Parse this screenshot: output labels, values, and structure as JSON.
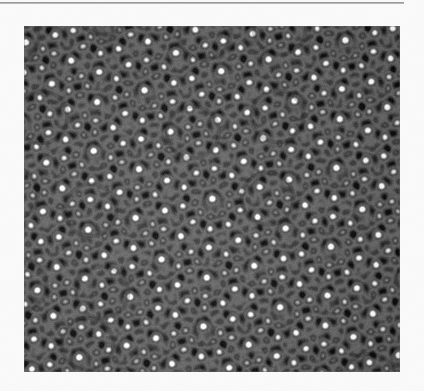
{
  "page": {
    "width": 424,
    "height": 391,
    "background_color": "#fafafa",
    "kind": "scanned-journal-page-fragment"
  },
  "column_rule": {
    "name": "horizontal-rule",
    "x": 0,
    "y": 2,
    "width": 404,
    "height": 2,
    "color": "#9a9a9a"
  },
  "figure": {
    "x": 24,
    "y": 26,
    "width": 376,
    "height": 346,
    "caption": "",
    "alt": "High-resolution electron micrograph of a decagonal quasicrystal showing bright atomic columns arranged in decagonal rings with dark star-shaped voids",
    "border_color": "#6b6b6b"
  },
  "chart_data": {
    "type": "heatmap",
    "title": "",
    "subtitle": "",
    "xlabel": "",
    "ylabel": "",
    "grid": false,
    "legend": null,
    "colormap": "grayscale",
    "value_range": [
      0,
      1
    ],
    "display_gray_min": 18,
    "display_gray_max": 248,
    "generator": {
      "model": "sum-of-plane-waves",
      "n_waves": 5,
      "symmetry_fold": 10,
      "base_wavevector_k": 0.62,
      "phase_offsets_deg": [
        0,
        0,
        0,
        0,
        0
      ],
      "rotation_deg": 4,
      "harmonic_waves": 5,
      "harmonic_k_ratio": 1.618,
      "harmonic_amplitude": 0.42,
      "contrast_gamma": 0.78,
      "contrast_gain": 1.42,
      "ring_sharpen_amount": 0.85,
      "blob_threshold": 0.56,
      "noise_amplitude": 0.055,
      "blur_radius_px": 0.9,
      "sample_scale_px_per_unit": 9.4
    },
    "motifs": [
      {
        "name": "bright-atomic-column",
        "gray": 232,
        "approx_count": 1400,
        "diameter_px": 9
      },
      {
        "name": "dark-ring",
        "gray": 54,
        "approx_count": 520,
        "outer_diameter_px": 13
      },
      {
        "name": "decagonal-cluster-ring",
        "gray": 48,
        "approx_count": 34,
        "diameter_px": 52,
        "vertices": 10
      },
      {
        "name": "dark-star-void",
        "gray": 24,
        "approx_count": 22,
        "diameter_px": 16,
        "points": 5
      },
      {
        "name": "mid-gray-matrix",
        "gray": 150,
        "coverage_percent": 46
      }
    ],
    "axis_ranges": {
      "x": [
        0,
        376
      ],
      "y": [
        0,
        346
      ]
    },
    "tick_labels": {
      "x": [],
      "y": []
    }
  }
}
